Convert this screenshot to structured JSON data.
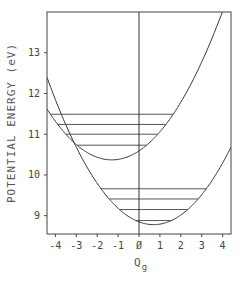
{
  "chart_data": {
    "type": "line",
    "title": "",
    "xlabel": "Q",
    "xlabel_subscript": "g",
    "ylabel": "POTENTIAL ENERGY (eV)",
    "xlim": [
      -4.4,
      4.4
    ],
    "ylim": [
      8.55,
      14.0
    ],
    "xticks": [
      -4,
      -3,
      -2,
      -1,
      0,
      1,
      2,
      3,
      4
    ],
    "xtick_labels": [
      "-4",
      "-3",
      "-2",
      "-1",
      "Ø",
      "1",
      "2",
      "3",
      "4"
    ],
    "yticks": [
      9,
      10,
      11,
      12,
      13
    ],
    "ytick_labels": [
      "9",
      "10",
      "11",
      "12",
      "13"
    ],
    "grid": false,
    "legend": null,
    "vertical_reference_line_x": 0,
    "series": [
      {
        "name": "upper potential surface",
        "kind": "parabola",
        "center_q": -1.3,
        "min_energy": 10.37,
        "curvature": 0.13,
        "vibrational_levels_eV": [
          10.73,
          11.0,
          11.24,
          11.49
        ]
      },
      {
        "name": "lower potential surface",
        "kind": "parabola",
        "center_q": 0.7,
        "min_energy": 8.78,
        "curvature": 0.139,
        "vibrational_levels_eV": [
          8.88,
          9.15,
          9.41,
          9.66
        ]
      }
    ]
  }
}
